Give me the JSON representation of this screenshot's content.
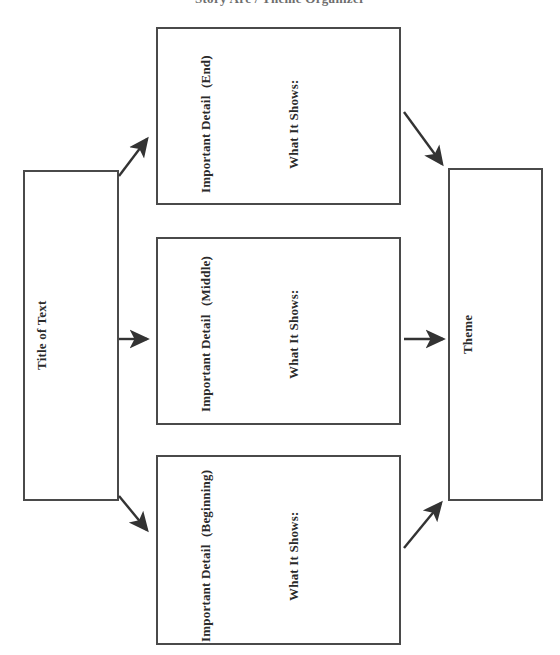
{
  "document": {
    "clipped_heading": "Story Arc / Theme Organizer",
    "type": "graphic-organizer"
  },
  "nodes": {
    "title_of_text": {
      "label": "Title of Text",
      "orientation": "vertical-bottom-to-top"
    },
    "theme": {
      "label": "Theme",
      "orientation": "vertical-bottom-to-top"
    },
    "details": [
      {
        "id": "end",
        "heading": "Important Detail",
        "stage": "(End)",
        "prompt": "What It Shows:"
      },
      {
        "id": "middle",
        "heading": "Important Detail",
        "stage": "(Middle)",
        "prompt": "What It Shows:"
      },
      {
        "id": "beginning",
        "heading": "Important Detail",
        "stage": "(Beginning)",
        "prompt": "What It Shows:"
      }
    ]
  },
  "connectors": [
    {
      "id": "title-to-end",
      "from": "title_of_text",
      "to": "end",
      "style": "diagonal-up-right"
    },
    {
      "id": "title-to-middle",
      "from": "title_of_text",
      "to": "middle",
      "style": "horizontal-right"
    },
    {
      "id": "title-to-beginning",
      "from": "title_of_text",
      "to": "beginning",
      "style": "diagonal-down-right"
    },
    {
      "id": "end-to-theme",
      "from": "end",
      "to": "theme",
      "style": "diagonal-down-right"
    },
    {
      "id": "middle-to-theme",
      "from": "middle",
      "to": "theme",
      "style": "horizontal-right"
    },
    {
      "id": "beginning-to-theme",
      "from": "beginning",
      "to": "theme",
      "style": "diagonal-up-right"
    }
  ],
  "style": {
    "border_color": "#4a4a4a",
    "text_color": "#2a2a2a",
    "arrow_color": "#333333",
    "background": "#ffffff"
  }
}
